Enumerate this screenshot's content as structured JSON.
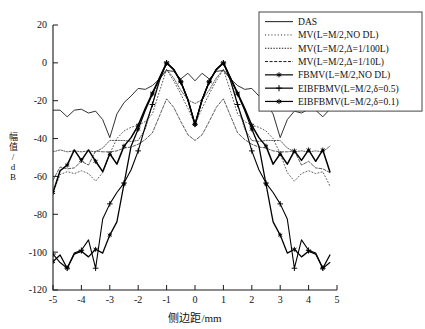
{
  "chart_data": {
    "type": "line",
    "title": "",
    "xlabel": "侧边距/mm",
    "ylabel": "幅值/dB",
    "xlim": [
      -5,
      5
    ],
    "ylim": [
      -120,
      20
    ],
    "xticks": [
      -5,
      -4,
      -3,
      -2,
      -1,
      0,
      1,
      2,
      3,
      4,
      5
    ],
    "xticklabels": [
      "-5",
      "-4",
      "-3",
      "-2",
      "-1",
      "0",
      "1",
      "2",
      "3",
      "4",
      "5"
    ],
    "yticks": [
      20,
      0,
      -20,
      -40,
      -60,
      -80,
      -100,
      -120
    ],
    "yticklabels": [
      "20",
      "0",
      "-20",
      "-40",
      "-60",
      "-80",
      "-100",
      "-120"
    ],
    "grid": false,
    "legend_position": "top-right",
    "x": [
      -5.0,
      -4.75,
      -4.5,
      -4.25,
      -4.0,
      -3.75,
      -3.5,
      -3.25,
      -3.0,
      -2.75,
      -2.5,
      -2.25,
      -2.0,
      -1.75,
      -1.5,
      -1.25,
      -1.0,
      -0.75,
      -0.5,
      -0.25,
      0.0,
      0.25,
      0.5,
      0.75,
      1.0,
      1.25,
      1.5,
      1.75,
      2.0,
      2.25,
      2.5,
      2.75,
      3.0,
      3.25,
      3.5,
      3.75,
      4.0,
      4.25,
      4.5,
      4.75
    ],
    "series": [
      {
        "name": "DAS",
        "label": "DAS",
        "style": "solid",
        "marker": "none",
        "width": 0.9,
        "color": "#1a1a1a",
        "values": [
          -25,
          -25,
          -28.5,
          -25,
          -24.5,
          -26.5,
          -25.5,
          -30,
          -39.5,
          -27,
          -21,
          -17.5,
          -13.5,
          -14,
          -12,
          -8.5,
          -4,
          -4.5,
          -8.5,
          -5.5,
          -9.5,
          -5.5,
          -8.5,
          -4.5,
          -4,
          -8.5,
          -12,
          -14,
          -13.5,
          -17.5,
          -21,
          -27,
          -39.5,
          -30,
          -25.5,
          -26.5,
          -24.5,
          -25,
          -28.5,
          -24.5
        ]
      },
      {
        "name": "MV_NO_DL",
        "label": "MV(L=M/2,NO DL)",
        "style": "dotted-fine",
        "marker": "none",
        "width": 0.8,
        "color": "#333333",
        "values": [
          -68.5,
          -59,
          -57.5,
          -58.5,
          -57,
          -58.5,
          -62.5,
          -58,
          -48,
          -40,
          -36,
          -34,
          -33,
          -31,
          -27,
          -15,
          -3.5,
          -9.5,
          -16.5,
          -24,
          -32.5,
          -24,
          -16.5,
          -9.5,
          -3.5,
          -15,
          -27,
          -31,
          -33,
          -34,
          -36,
          -40,
          -48,
          -58,
          -62.5,
          -58.5,
          -57,
          -58.5,
          -57.5,
          -65
        ]
      },
      {
        "name": "MV_1_100L",
        "label": "MV(L=M/2,Δ=1/100L)",
        "style": "dotted-dense",
        "marker": "none",
        "width": 0.8,
        "color": "#333333",
        "values": [
          -47,
          -46,
          -47,
          -46.5,
          -47,
          -46.5,
          -47,
          -45,
          -41,
          -41,
          -41,
          -41.5,
          -41,
          -35,
          -22,
          -8,
          -3.5,
          -8,
          -14.5,
          -19.5,
          -21.5,
          -19.5,
          -14.5,
          -8,
          -3.5,
          -8,
          -22,
          -35,
          -41,
          -41.5,
          -41,
          -41,
          -41,
          -45,
          -47,
          -46.5,
          -47,
          -46.5,
          -47,
          -44
        ]
      },
      {
        "name": "MV_1_10L",
        "label": "MV(L=M/2,Δ=1/10L)",
        "style": "dashed",
        "marker": "none",
        "width": 0.8,
        "color": "#333333",
        "values": [
          -62,
          -55,
          -56,
          -55.5,
          -52,
          -54,
          -46.5,
          -47,
          -47,
          -46.5,
          -45,
          -44.5,
          -43,
          -40.5,
          -37,
          -28,
          -19,
          -23.5,
          -31,
          -38,
          -41,
          -38,
          -31,
          -23.5,
          -19,
          -28,
          -37,
          -40.5,
          -43,
          -44.5,
          -45,
          -46.5,
          -47,
          -47,
          -46.5,
          -54,
          -52,
          -55.5,
          -56,
          -58
        ]
      },
      {
        "name": "FBMV_NO_DL",
        "label": "FBMV(L=M/2,NO DL)",
        "style": "solid",
        "marker": "star",
        "width": 1.5,
        "color": "#000000",
        "values": [
          -68.5,
          -57,
          -54,
          -46,
          -51.5,
          -46,
          -52,
          -57.5,
          -48,
          -53.5,
          -44,
          -39.5,
          -33,
          -24,
          -16,
          -8,
          0,
          -3.5,
          -10,
          -19.5,
          -32.5,
          -19.5,
          -10,
          -3.5,
          0,
          -8,
          -16,
          -24,
          -33,
          -39.5,
          -44,
          -53.5,
          -48,
          -53.5,
          -46.5,
          -51.5,
          -46,
          -52,
          -46,
          -57.5
        ]
      },
      {
        "name": "EIBFBMV_0_5",
        "label": "EIBFBMV(L=M/2,δ=0.5)",
        "style": "solid",
        "marker": "plus",
        "width": 1.1,
        "color": "#000000",
        "values": [
          -101,
          -105.5,
          -108.5,
          -100.5,
          -99,
          -93.5,
          -108.5,
          -82.5,
          -74.5,
          -68.5,
          -63.5,
          -56.5,
          -46.5,
          -33.5,
          -22,
          -9.5,
          0,
          -3.5,
          -10,
          -19.5,
          -32.5,
          -19.5,
          -10,
          -3.5,
          0,
          -9.5,
          -22,
          -33.5,
          -46.5,
          -56.5,
          -63.5,
          -68.5,
          -74.5,
          -82.5,
          -108.5,
          -93.5,
          -99,
          -100.5,
          -108.5,
          -105.5
        ]
      },
      {
        "name": "EIBFBMV_0_1",
        "label": "EIBFBMV(L=M/2,δ=0.1)",
        "style": "solid",
        "marker": "star",
        "width": 1.3,
        "color": "#000000",
        "values": [
          -105,
          -101.5,
          -108.5,
          -101,
          -99.5,
          -102.5,
          -98.5,
          -100.5,
          -91,
          -84,
          -64,
          -44,
          -35,
          -25,
          -16.5,
          -8,
          0,
          -3.5,
          -10,
          -19.5,
          -32.5,
          -19.5,
          -10,
          -3.5,
          0,
          -8,
          -16.5,
          -25,
          -35,
          -44,
          -64,
          -84,
          -91,
          -100.5,
          -98.5,
          -102.5,
          -99.5,
          -101,
          -108.5,
          -101.5
        ]
      }
    ],
    "legend": [
      {
        "label": "DAS",
        "style": "solid",
        "marker": "none"
      },
      {
        "label": "MV(L=M/2,NO DL)",
        "style": "dotted-fine",
        "marker": "none"
      },
      {
        "label": "MV(L=M/2,Δ=1/100L)",
        "style": "dotted-dense",
        "marker": "none"
      },
      {
        "label": "MV(L=M/2,Δ=1/10L)",
        "style": "dashed",
        "marker": "none"
      },
      {
        "label": "FBMV(L=M/2,NO DL)",
        "style": "solid",
        "marker": "star"
      },
      {
        "label": "EIBFBMV(L=M/2,δ=0.5)",
        "style": "solid",
        "marker": "plus"
      },
      {
        "label": "EIBFBMV(L=M/2,δ=0.1)",
        "style": "solid",
        "marker": "star"
      }
    ],
    "colors": {
      "axis": "#1a1a1a",
      "curve": "#000000",
      "background": "#ffffff",
      "legend_border": "#444444"
    }
  },
  "axis": {
    "ylabel_chars": [
      "幅",
      "值",
      "/",
      "d",
      "B"
    ]
  }
}
